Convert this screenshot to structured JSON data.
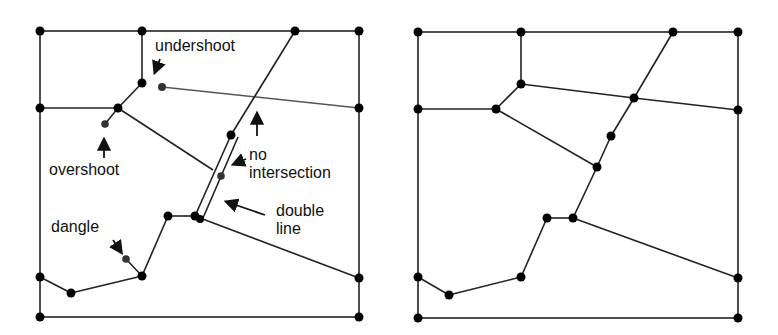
{
  "figure": {
    "left_panel": {
      "title": "",
      "labels": {
        "undershoot": "undershoot",
        "overshoot": "overshoot",
        "no_intersection_1": "no",
        "no_intersection_2": "intersection",
        "double_line_1": "double",
        "double_line_2": "line",
        "dangle": "dangle"
      }
    },
    "right_panel": {
      "title": ""
    },
    "colors": {
      "line": "#222222",
      "node": "#000000",
      "error_node": "#333333",
      "background": "#ffffff"
    }
  }
}
